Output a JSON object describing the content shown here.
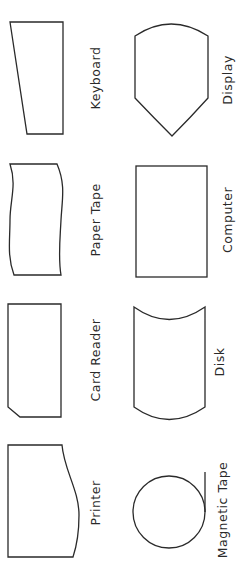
{
  "diagram": {
    "title": "",
    "symbols": [
      {
        "id": "keyboard",
        "label": "Keyboard"
      },
      {
        "id": "display",
        "label": "Display"
      },
      {
        "id": "paper-tape",
        "label": "Paper Tape"
      },
      {
        "id": "computer",
        "label": "Computer"
      },
      {
        "id": "card-reader",
        "label": "Card Reader"
      },
      {
        "id": "disk",
        "label": "Disk"
      },
      {
        "id": "printer",
        "label": "Printer"
      },
      {
        "id": "magnetic-tape",
        "label": "Magnetic Tape"
      }
    ],
    "colors": {
      "stroke": "#2a2a2a",
      "background": "#ffffff"
    }
  }
}
